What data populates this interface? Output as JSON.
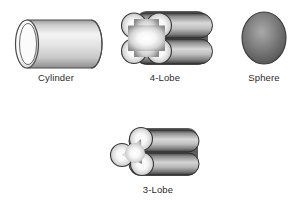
{
  "figure": {
    "background_color": "#ffffff",
    "label_color": "#2b2b2b",
    "caption_fragment": ""
  },
  "shapes": [
    {
      "id": "cylinder",
      "label": "Cylinder",
      "icon": "cylinder-shape-icon",
      "description": "Hollow circular cylinder viewed at an angle, open elliptical end at left",
      "lobes": 1
    },
    {
      "id": "four-lobe",
      "label": "4-Lobe",
      "icon": "quatrefoil-extrudate-shape-icon",
      "description": "Quatrefoil cross-section extrudate with two stacked rounded bars",
      "lobes": 4
    },
    {
      "id": "sphere",
      "label": "Sphere",
      "icon": "sphere-shape-icon",
      "description": "Shaded spherical bead",
      "lobes": 0
    },
    {
      "id": "three-lobe",
      "label": "3-Lobe",
      "icon": "trefoil-extrudate-shape-icon",
      "description": "Trefoil cross-section extrudate with two stacked rounded bars",
      "lobes": 3
    }
  ]
}
